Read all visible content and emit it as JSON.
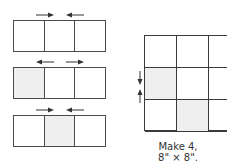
{
  "diagram": {
    "colors": {
      "line": "#4a4a4a",
      "shaded": "#efefef",
      "background": "#ffffff"
    },
    "strips": [
      {
        "cells": [
          "plain",
          "plain",
          "plain"
        ],
        "arrows": [
          "right",
          "left"
        ]
      },
      {
        "cells": [
          "shaded",
          "plain",
          "plain"
        ],
        "arrows": [
          "left",
          "right"
        ]
      },
      {
        "cells": [
          "plain",
          "shaded",
          "plain"
        ],
        "arrows": [
          "right",
          "left"
        ]
      }
    ],
    "block": {
      "rows": [
        [
          "plain",
          "plain",
          "plain"
        ],
        [
          "shaded",
          "plain",
          "plain"
        ],
        [
          "plain",
          "shaded",
          "plain"
        ]
      ],
      "seam_arrows": [
        "down",
        "up"
      ]
    },
    "caption": {
      "line1": "Make 4,",
      "line2": "8\" × 8\"."
    }
  }
}
